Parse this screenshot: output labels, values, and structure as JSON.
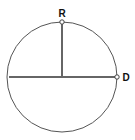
{
  "diagram": {
    "circle": {
      "cx": 62,
      "cy": 77,
      "r": 55,
      "stroke": "#555555"
    },
    "segments": [
      {
        "name": "vertical-radius",
        "x1": 62,
        "y1": 22,
        "x2": 62,
        "y2": 77,
        "stroke": "#666666"
      },
      {
        "name": "horizontal-diameter",
        "x1": 9,
        "y1": 77,
        "x2": 117,
        "y2": 77,
        "stroke": "#666666"
      }
    ],
    "points": [
      {
        "label": "R",
        "x": 62,
        "y": 22,
        "label_x": 62,
        "label_y": 17
      },
      {
        "label": "D",
        "x": 117,
        "y": 77,
        "label_x": 126,
        "label_y": 81
      }
    ]
  }
}
